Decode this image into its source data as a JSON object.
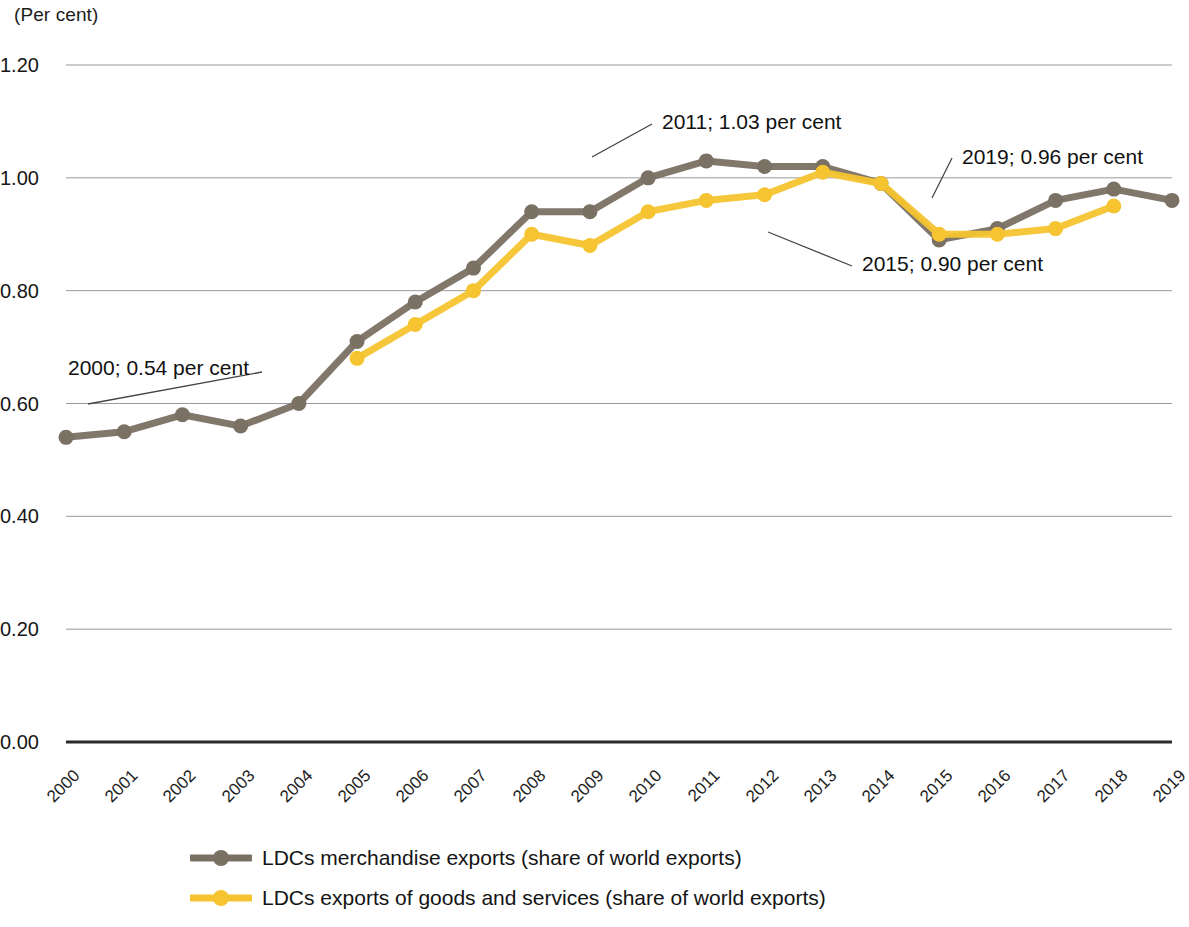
{
  "axis_unit": "(Per cent)",
  "colors": {
    "series_merchandise": "#7a7063",
    "series_goods_services": "#f5c430",
    "gridline": "#9a9a9a",
    "baseline": "#2b2b2b",
    "text": "#111111",
    "leader": "#444444"
  },
  "legend": {
    "items": [
      {
        "label": "LDCs merchandise exports (share of world exports)",
        "color": "#7a7063",
        "marker": "line-with-dot"
      },
      {
        "label": "LDCs exports of goods and services (share of world exports)",
        "color": "#f5c430",
        "marker": "line-with-dot"
      }
    ]
  },
  "annotations": [
    {
      "id": "ann-2000",
      "text": "2000; 0.54 per cent",
      "year": 2000,
      "value": 0.54
    },
    {
      "id": "ann-2011",
      "text": "2011; 1.03 per cent",
      "year": 2011,
      "value": 1.03
    },
    {
      "id": "ann-2019",
      "text": "2019; 0.96 per cent",
      "year": 2019,
      "value": 0.96
    },
    {
      "id": "ann-2015",
      "text": "2015; 0.90 per cent",
      "year": 2015,
      "value": 0.9
    }
  ],
  "chart_data": {
    "type": "line",
    "title": "",
    "subtitle": "",
    "xlabel": "",
    "ylabel": "(Per cent)",
    "ylim": [
      0.0,
      1.2
    ],
    "ytick_labels": [
      "1.20",
      "1.00",
      "0.80",
      "0.60",
      "0.40",
      "0.20",
      "0.00"
    ],
    "yticks": [
      1.2,
      1.0,
      0.8,
      0.6,
      0.4,
      0.2,
      0.0
    ],
    "grid": true,
    "legend_position": "bottom",
    "x": [
      2000,
      2001,
      2002,
      2003,
      2004,
      2005,
      2006,
      2007,
      2008,
      2009,
      2010,
      2011,
      2012,
      2013,
      2014,
      2015,
      2016,
      2017,
      2018,
      2019
    ],
    "categories": [
      "2000",
      "2001",
      "2002",
      "2003",
      "2004",
      "2005",
      "2006",
      "2007",
      "2008",
      "2009",
      "2010",
      "2011",
      "2012",
      "2013",
      "2014",
      "2015",
      "2016",
      "2017",
      "2018",
      "2019"
    ],
    "series": [
      {
        "name": "LDCs merchandise exports (share of world exports)",
        "color": "#7a7063",
        "values": [
          0.54,
          0.55,
          0.58,
          0.56,
          0.6,
          0.71,
          0.78,
          0.84,
          0.94,
          0.94,
          1.0,
          1.03,
          1.02,
          1.02,
          0.99,
          0.89,
          0.91,
          0.96,
          0.98,
          0.96
        ]
      },
      {
        "name": "LDCs exports of goods and services (share of world exports)",
        "color": "#f5c430",
        "values": [
          null,
          null,
          null,
          null,
          null,
          0.68,
          0.74,
          0.8,
          0.9,
          0.88,
          0.94,
          0.96,
          0.97,
          1.01,
          0.99,
          0.9,
          0.9,
          0.91,
          0.95,
          null
        ]
      }
    ]
  }
}
